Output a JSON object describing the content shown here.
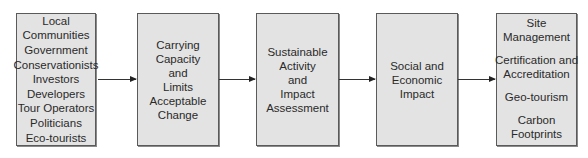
{
  "diagram": {
    "type": "flow",
    "direction": "left-to-right",
    "colors": {
      "box_fill": "#e3e3e3",
      "box_border": "#5a5a5a",
      "arrow": "#333333"
    },
    "boxes": [
      {
        "id": "stakeholders",
        "lines": [
          "Local",
          "Communities",
          "Government",
          "Conservationists",
          "Investors",
          "Developers",
          "Tour Operators",
          "Politicians",
          "Eco-tourists"
        ]
      },
      {
        "id": "carrying-capacity",
        "lines": [
          "Carrying",
          "Capacity",
          "and",
          "Limits",
          "Acceptable",
          "Change"
        ]
      },
      {
        "id": "sustainable-activity",
        "lines": [
          "Sustainable",
          "Activity",
          "and",
          "Impact",
          "Assessment"
        ]
      },
      {
        "id": "social-economic",
        "lines": [
          "Social and",
          "Economic",
          "Impact"
        ]
      },
      {
        "id": "outcomes",
        "groups": [
          [
            "Site",
            "Management"
          ],
          [
            "Certification and",
            "Accreditation"
          ],
          [
            "Geo-tourism"
          ],
          [
            "Carbon",
            "Footprints"
          ]
        ]
      }
    ],
    "arrows": [
      {
        "from": "stakeholders",
        "to": "carrying-capacity"
      },
      {
        "from": "carrying-capacity",
        "to": "sustainable-activity"
      },
      {
        "from": "sustainable-activity",
        "to": "social-economic"
      },
      {
        "from": "social-economic",
        "to": "outcomes"
      }
    ]
  }
}
